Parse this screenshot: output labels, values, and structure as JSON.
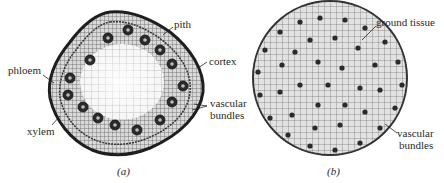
{
  "figure": {
    "panel_a": {
      "caption": "(a)",
      "labels": {
        "pith": "pith",
        "cortex": "cortex",
        "phloem": "phloem",
        "xylem": "xylem",
        "vascular_line1": "vascular",
        "vascular_line2": "bundles"
      }
    },
    "panel_b": {
      "caption": "(b)",
      "labels": {
        "ground_tissue": "ground tissue",
        "vascular_line1": "vascular",
        "vascular_line2": "bundles"
      }
    },
    "colors": {
      "ink": "#1e1e1e",
      "tissue": "#8a8a8a",
      "background": "#ffffff"
    }
  }
}
